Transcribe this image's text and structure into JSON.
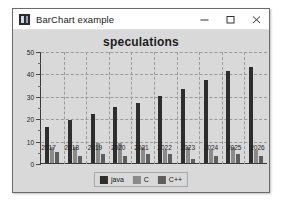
{
  "window": {
    "title": "BarChart example",
    "icon": "app-window-icon",
    "controls": [
      {
        "name": "minimize-button",
        "glyph": "minimize-icon",
        "label": "Minimize"
      },
      {
        "name": "maximize-button",
        "glyph": "maximize-icon",
        "label": "Maximize"
      },
      {
        "name": "close-button",
        "glyph": "close-icon",
        "label": "Close"
      }
    ]
  },
  "chart_data": {
    "type": "bar",
    "title": "speculations",
    "xlabel": "",
    "ylabel": "",
    "categories": [
      "2017",
      "2018",
      "2019",
      "2020",
      "2021",
      "2022",
      "2023",
      "2024",
      "2025",
      "2026"
    ],
    "series": [
      {
        "name": "java",
        "color": "#2e2e2e",
        "values": [
          16,
          19,
          22,
          25,
          27,
          30,
          33,
          37,
          41,
          43
        ]
      },
      {
        "name": "C",
        "color": "#8a8a8a",
        "values": [
          7,
          7,
          9,
          9,
          7,
          6,
          7,
          6,
          7,
          6
        ]
      },
      {
        "name": "C++",
        "color": "#5e5e5e",
        "values": [
          5,
          3,
          4,
          3,
          4,
          4,
          2,
          3,
          4,
          3
        ]
      }
    ],
    "ylim": [
      0,
      50
    ],
    "yticks": [
      0,
      10,
      20,
      30,
      40,
      50
    ],
    "yticks_minor": [
      5,
      15,
      25,
      35,
      45
    ],
    "grid": true,
    "legend_position": "bottom",
    "legend_entries": [
      "java",
      "C",
      "C++"
    ]
  },
  "colors": {
    "panel_background": "#d9d9d9",
    "titlebar_background": "#ffffff",
    "gridline": "#9a9a9a",
    "axis": "#3b3b3b"
  }
}
